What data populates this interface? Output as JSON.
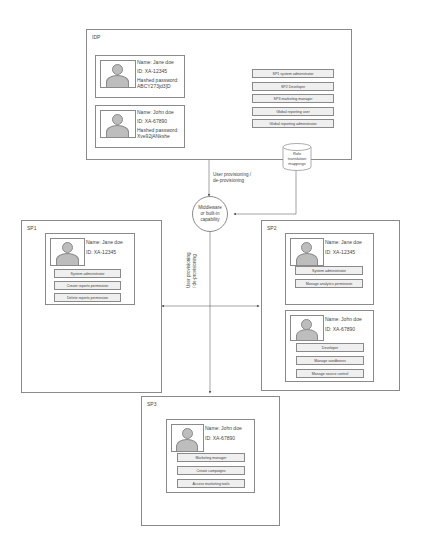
{
  "idp": {
    "label": "IDP",
    "users": [
      {
        "name": "Name: Jane doe",
        "id": "ID: XA-12345",
        "password_label": "Hashed password:",
        "password_value": "ABCY273jd3]D"
      },
      {
        "name": "Name: John doe",
        "id": "ID: XA-67890",
        "password_label": "Hashed password:",
        "password_value": "Xve92jANkshe"
      }
    ],
    "roles": [
      "SP1 system administrator",
      "SP2 Developer",
      "SP3 marketing manager",
      "Global reporting user",
      "Global reporting administrator"
    ]
  },
  "role_store": {
    "label_lines": [
      "Role",
      "translation",
      "mappings"
    ]
  },
  "provisioning_note": {
    "lines": [
      "User provisioning /",
      "de-provisioning"
    ]
  },
  "middleware": {
    "lines": [
      "Middleware",
      "or built-in",
      "capability"
    ]
  },
  "vertical_note": {
    "lines": [
      "User provisioning",
      "/ de-provisioning"
    ]
  },
  "sp1": {
    "label": "SP1",
    "users": [
      {
        "name": "Name: Jane doe",
        "id": "ID: XA-12345",
        "roles": [
          "System administrator",
          "Create reports permission",
          "Delete reports permission"
        ]
      }
    ]
  },
  "sp2": {
    "label": "SP2",
    "users": [
      {
        "name": "Name: Jane doe",
        "id": "ID: XA-12345",
        "roles": [
          "System administrator",
          "Manage analytics permission"
        ]
      },
      {
        "name": "Name: John doe",
        "id": "ID: XA-67890",
        "roles": [
          "Developer",
          "Manage sandboxes",
          "Manage source control"
        ]
      }
    ]
  },
  "sp3": {
    "label": "SP3",
    "users": [
      {
        "name": "Name: John doe",
        "id": "ID: XA-67890",
        "roles": [
          "Marketing manager",
          "Create campaigns",
          "Access marketing tools"
        ]
      }
    ]
  },
  "colors": {
    "stroke": "#8a8a8a",
    "role_fill": "#efefef",
    "avatar_fill": "#bdbdbd"
  }
}
